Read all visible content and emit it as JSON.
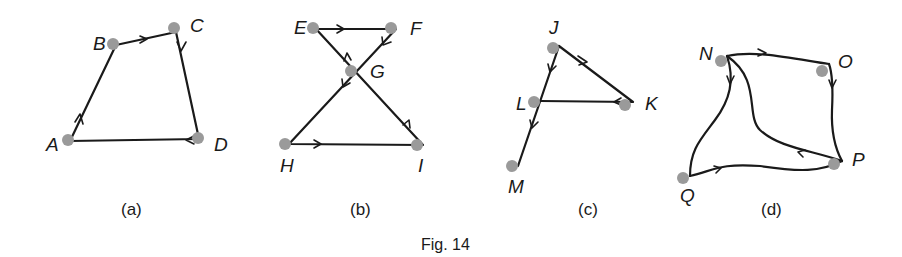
{
  "figure": {
    "caption": "Fig. 14",
    "subfigures": [
      {
        "label": "(a)",
        "vertices": [
          {
            "name": "A",
            "x": 68,
            "y": 142
          },
          {
            "name": "B",
            "x": 112,
            "y": 44
          },
          {
            "name": "C",
            "x": 174,
            "y": 28
          },
          {
            "name": "D",
            "x": 199,
            "y": 140
          }
        ],
        "edges": [
          {
            "from": "A",
            "to": "B",
            "directed": true
          },
          {
            "from": "B",
            "to": "C",
            "directed": true
          },
          {
            "from": "C",
            "to": "D",
            "directed": true
          },
          {
            "from": "D",
            "to": "A",
            "directed": true
          }
        ]
      },
      {
        "label": "(b)",
        "vertices": [
          {
            "name": "E",
            "x": 313,
            "y": 28
          },
          {
            "name": "F",
            "x": 392,
            "y": 28
          },
          {
            "name": "G",
            "x": 351,
            "y": 70
          },
          {
            "name": "H",
            "x": 286,
            "y": 144
          },
          {
            "name": "I",
            "x": 417,
            "y": 145
          }
        ],
        "edges": [
          {
            "from": "E",
            "to": "F",
            "directed": true
          },
          {
            "from": "F",
            "to": "G",
            "directed": true
          },
          {
            "from": "G",
            "to": "H",
            "directed": true
          },
          {
            "from": "H",
            "to": "I",
            "directed": true
          },
          {
            "from": "I",
            "to": "G",
            "directed": true
          },
          {
            "from": "G",
            "to": "E",
            "directed": true
          }
        ]
      },
      {
        "label": "(c)",
        "vertices": [
          {
            "name": "J",
            "x": 553,
            "y": 48
          },
          {
            "name": "K",
            "x": 625,
            "y": 105
          },
          {
            "name": "L",
            "x": 534,
            "y": 102
          },
          {
            "name": "M",
            "x": 512,
            "y": 165
          }
        ],
        "edges": [
          {
            "from": "J",
            "to": "K",
            "directed": true
          },
          {
            "from": "K",
            "to": "L",
            "directed": true
          },
          {
            "from": "J",
            "to": "L",
            "directed": true
          },
          {
            "from": "L",
            "to": "M",
            "directed": true
          }
        ]
      },
      {
        "label": "(d)",
        "vertices": [
          {
            "name": "N",
            "x": 720,
            "y": 60
          },
          {
            "name": "O",
            "x": 822,
            "y": 70
          },
          {
            "name": "P",
            "x": 833,
            "y": 163
          },
          {
            "name": "Q",
            "x": 683,
            "y": 178
          }
        ],
        "edges": [
          {
            "from": "N",
            "to": "O",
            "directed": true,
            "curve": true
          },
          {
            "from": "O",
            "to": "P",
            "directed": true,
            "curve": true
          },
          {
            "from": "P",
            "to": "N",
            "directed": true,
            "curve": true
          },
          {
            "from": "N",
            "to": "Q",
            "directed": true,
            "curve": true
          },
          {
            "from": "Q",
            "to": "P",
            "directed": true,
            "curve": true
          }
        ]
      }
    ]
  }
}
